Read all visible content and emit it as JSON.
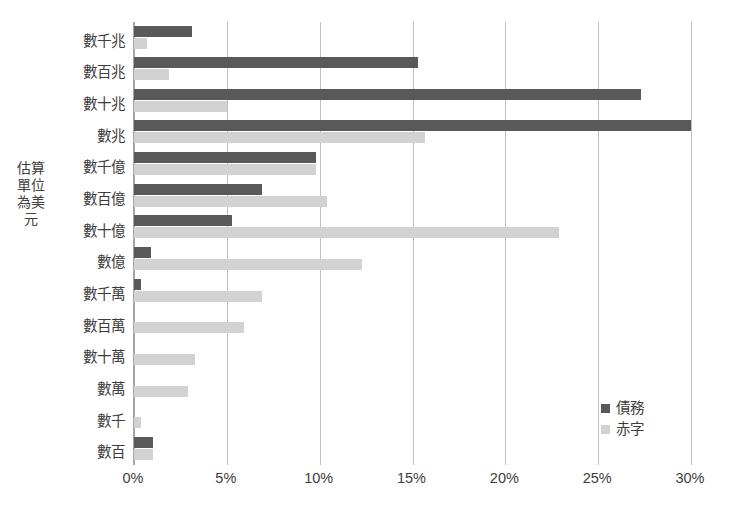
{
  "chart_data": {
    "type": "bar",
    "orientation": "horizontal",
    "title": "",
    "subtitle": "",
    "xlabel": "",
    "ylabel": "估算單位為美元",
    "xlim": [
      0,
      30
    ],
    "xticks": [
      "0%",
      "5%",
      "10%",
      "15%",
      "20%",
      "25%",
      "30%"
    ],
    "xtick_values": [
      0,
      5,
      10,
      15,
      20,
      25,
      30
    ],
    "grid": true,
    "legend_position": "bottom-right",
    "categories": [
      "數千兆",
      "數百兆",
      "數十兆",
      "數兆",
      "數千億",
      "數百億",
      "數十億",
      "數億",
      "數千萬",
      "數百萬",
      "數十萬",
      "數萬",
      "數千",
      "數百"
    ],
    "series": [
      {
        "name": "債務",
        "color": "#595959",
        "values": [
          3.1,
          15.3,
          27.3,
          30.0,
          9.8,
          6.9,
          5.3,
          0.9,
          0.4,
          0.0,
          0.0,
          0.0,
          0.0,
          1.0
        ]
      },
      {
        "name": "赤字",
        "color": "#d2d2d2",
        "values": [
          0.7,
          1.9,
          5.0,
          15.7,
          9.8,
          10.4,
          22.9,
          12.3,
          6.9,
          5.9,
          3.3,
          2.9,
          0.4,
          1.0
        ]
      }
    ]
  },
  "legend": {
    "items": [
      {
        "label": "債務",
        "color": "#595959"
      },
      {
        "label": "赤字",
        "color": "#d2d2d2"
      }
    ]
  }
}
